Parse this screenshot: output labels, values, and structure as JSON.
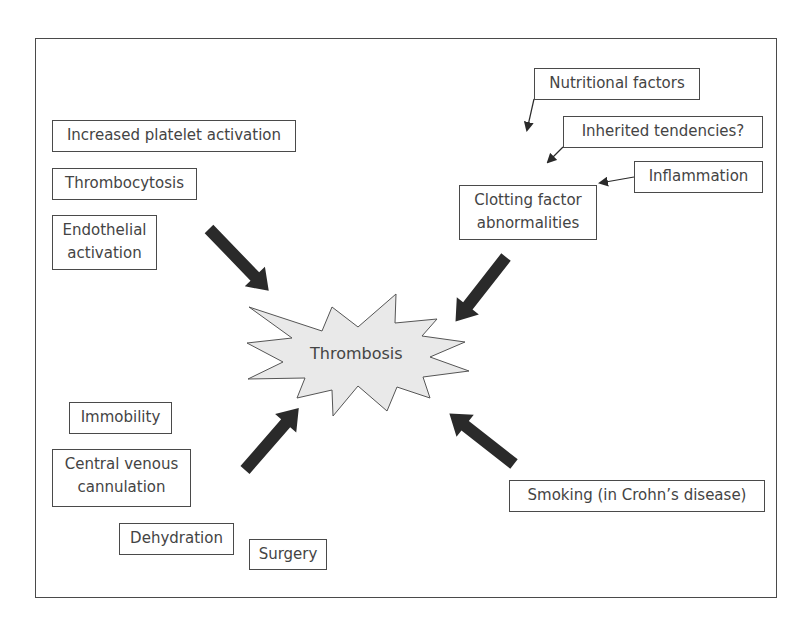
{
  "diagram": {
    "center": {
      "label": "Thrombosis",
      "fill": "#e9e9e9"
    },
    "factors": {
      "platelet": "Increased platelet activation",
      "thrombocytosis": "Thrombocytosis",
      "endothelial_line1": "Endothelial",
      "endothelial_line2": "activation",
      "nutritional": "Nutritional factors",
      "inherited": "Inherited tendencies?",
      "inflammation": "Inflammation",
      "clotting_line1": "Clotting factor",
      "clotting_line2": "abnormalities",
      "immobility": "Immobility",
      "cvc_line1": "Central venous",
      "cvc_line2": "cannulation",
      "dehydration": "Dehydration",
      "surgery": "Surgery",
      "smoking": "Smoking (in Crohn’s disease)"
    },
    "colors": {
      "arrow": "#2a2a2a",
      "border": "#4a4a4a",
      "text": "#444444"
    }
  }
}
